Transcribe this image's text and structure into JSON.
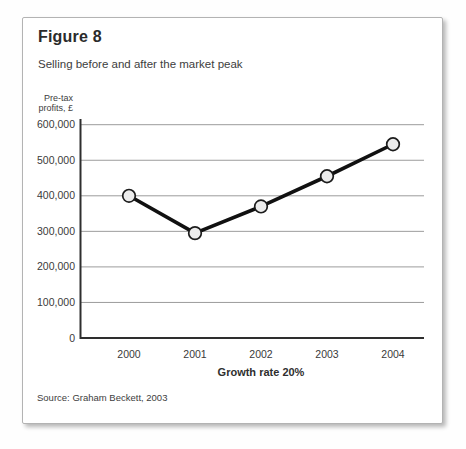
{
  "figure": {
    "title": "Figure 8",
    "subtitle": "Selling before and after the market peak",
    "y_unit_label": "Pre-tax\nprofits, £",
    "x_axis_caption": "Growth rate 20%",
    "source": "Source: Graham Beckett, 2003"
  },
  "ui": {
    "colors": {
      "card_background": "#ffffff",
      "card_border": "#b3b3b3",
      "grid": "#9c9c9c",
      "axis": "#2e2e2e",
      "text": "#3a3a3a",
      "line": "#111111",
      "marker_fill": "#ececec",
      "marker_stroke": "#1c1c1c"
    }
  },
  "chart_data": {
    "type": "line",
    "title": "Figure 8",
    "subtitle": "Selling before and after the market peak",
    "categories": [
      "2000",
      "2001",
      "2002",
      "2003",
      "2004"
    ],
    "series": [
      {
        "name": "Pre-tax profits, £",
        "values": [
          400000,
          295000,
          370000,
          455000,
          545000
        ]
      }
    ],
    "xlabel": "Growth rate 20%",
    "ylabel": "Pre-tax profits, £",
    "ylim": [
      0,
      600000
    ],
    "ytick_step": 100000,
    "yticks": [
      "0",
      "100,000",
      "200,000",
      "300,000",
      "400,000",
      "500,000",
      "600,000"
    ],
    "grid": true,
    "legend": "none",
    "marker": "circle",
    "line_color": "#111111",
    "marker_fill": "#ececec",
    "marker_stroke": "#1c1c1c",
    "source": "Source: Graham Beckett, 2003"
  }
}
